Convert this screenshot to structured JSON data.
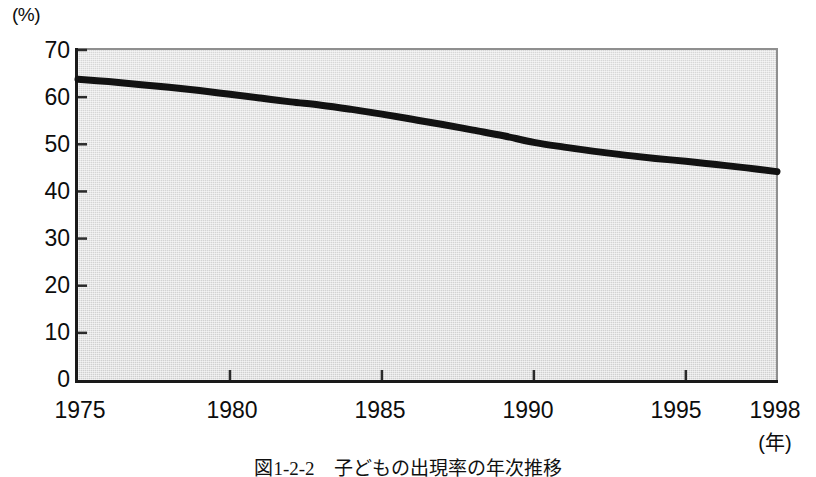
{
  "figure": {
    "caption": "図1-2-2　子どもの出現率の年次推移"
  },
  "axes": {
    "y_unit_label": "(%)",
    "x_unit_label": "(年)",
    "y_ticks": [
      "70",
      "60",
      "50",
      "40",
      "30",
      "20",
      "10",
      "0"
    ],
    "x_ticks": [
      "1975",
      "1980",
      "1985",
      "1990",
      "1995",
      "1998"
    ]
  },
  "colors": {
    "plot_background": "#d4d4d4",
    "line": "#121212",
    "axis": "#1a1a1a",
    "text": "#0d0d0d"
  },
  "chart_data": {
    "type": "line",
    "title": "図1-2-2　子どもの出現率の年次推移",
    "xlabel": "(年)",
    "ylabel": "(%)",
    "xlim": [
      1975,
      1998
    ],
    "ylim": [
      0,
      70
    ],
    "ytick_values": [
      0,
      10,
      20,
      30,
      40,
      50,
      60,
      70
    ],
    "xtick_values": [
      1975,
      1980,
      1985,
      1990,
      1995,
      1998
    ],
    "grid": false,
    "legend": null,
    "series": [
      {
        "name": "出現率",
        "x": [
          1975,
          1976,
          1977,
          1978,
          1979,
          1980,
          1981,
          1982,
          1983,
          1984,
          1985,
          1986,
          1987,
          1988,
          1989,
          1990,
          1991,
          1992,
          1993,
          1994,
          1995,
          1996,
          1997,
          1998
        ],
        "values": [
          63.8,
          63.3,
          62.7,
          62.1,
          61.4,
          60.6,
          59.8,
          59.0,
          58.3,
          57.4,
          56.4,
          55.3,
          54.2,
          53.0,
          51.8,
          50.4,
          49.4,
          48.5,
          47.7,
          47.0,
          46.4,
          45.7,
          45.0,
          44.2
        ]
      }
    ]
  }
}
